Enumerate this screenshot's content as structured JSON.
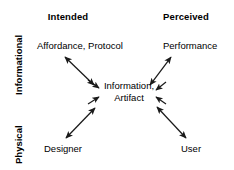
{
  "diagram": {
    "columns": [
      {
        "id": "intended",
        "label": "Intended"
      },
      {
        "id": "perceived",
        "label": "Perceived"
      }
    ],
    "rows": [
      {
        "id": "informational",
        "label": "Informational"
      },
      {
        "id": "physical",
        "label": "Physical"
      }
    ],
    "center": {
      "id": "information-artifact",
      "line1": "Information,",
      "line2": "Artifact"
    },
    "nodes": [
      {
        "id": "affordance-protocol",
        "label": "Affordance, Protocol",
        "row": "informational",
        "column": "intended"
      },
      {
        "id": "performance",
        "label": "Performance",
        "row": "informational",
        "column": "perceived"
      },
      {
        "id": "designer",
        "label": "Designer",
        "row": "physical",
        "column": "intended"
      },
      {
        "id": "user",
        "label": "User",
        "row": "physical",
        "column": "perceived"
      }
    ],
    "connections": [
      {
        "id": "affordance-protocol-to-center",
        "from": "affordance-protocol",
        "to": "information-artifact",
        "style": "double-headed-arrow"
      },
      {
        "id": "performance-to-center",
        "from": "performance",
        "to": "information-artifact",
        "style": "double-headed-arrow"
      },
      {
        "id": "designer-to-center",
        "from": "designer",
        "to": "information-artifact",
        "style": "double-headed-arrow"
      },
      {
        "id": "user-to-center",
        "from": "user",
        "to": "information-artifact",
        "style": "double-headed-arrow"
      }
    ],
    "colors": {
      "background": "#ffffff",
      "text": "#000000",
      "arrow": "#1a1a1a"
    }
  }
}
